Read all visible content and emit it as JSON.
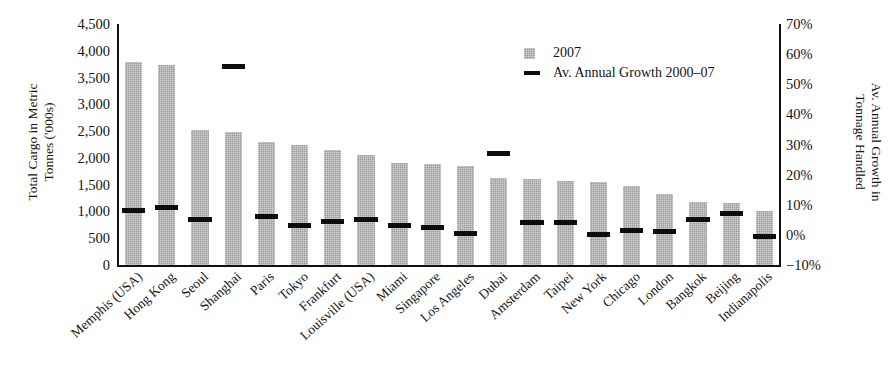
{
  "chart_data": {
    "type": "bar",
    "title": "",
    "subtitle": "",
    "xlabel": "",
    "ylabel": "Total Cargo in Metric Tonnes ('000s)",
    "ylabel_line1": "Total Cargo in Metric",
    "ylabel_line2": "Tonnes ('000s)",
    "y2label": "Av. Annual Growth in Tonnage Handled",
    "y2label_line1": "Av. Annual Growth in",
    "y2label_line2": "Tonnage Handled",
    "grid": false,
    "legend_position": "top-right",
    "ylim": [
      0,
      4500
    ],
    "y2lim": [
      -10,
      70
    ],
    "yticks": [
      0,
      500,
      1000,
      1500,
      2000,
      2500,
      3000,
      3500,
      4000,
      4500
    ],
    "ytick_labels": [
      "0",
      "500",
      "1,000",
      "1,500",
      "2,000",
      "2,500",
      "3,000",
      "3,500",
      "4,000",
      "4,500"
    ],
    "y2ticks": [
      -10,
      0,
      10,
      20,
      30,
      40,
      50,
      60,
      70
    ],
    "y2tick_labels": [
      "−10%",
      "0%",
      "10%",
      "20%",
      "30%",
      "40%",
      "50%",
      "60%",
      "70%"
    ],
    "categories": [
      "Memphis (USA)",
      "Hong Kong",
      "Seoul",
      "Shanghai",
      "Paris",
      "Tokyo",
      "Frankfurt",
      "Louisville (USA)",
      "Miami",
      "Singapore",
      "Los Angeles",
      "Dubai",
      "Amsterdam",
      "Taipei",
      "New York",
      "Chicago",
      "London",
      "Bangkok",
      "Beijing",
      "Indianapolis"
    ],
    "series": [
      {
        "name": "2007",
        "axis": "left",
        "unit": "'000 tonnes",
        "type": "bar",
        "color": "#9b9b9b",
        "values": [
          3800,
          3730,
          2530,
          2480,
          2290,
          2240,
          2140,
          2060,
          1900,
          1890,
          1840,
          1620,
          1600,
          1560,
          1550,
          1470,
          1330,
          1180,
          1150,
          1010
        ]
      },
      {
        "name": "Av. Annual Growth 2000–07",
        "axis": "right",
        "unit": "%",
        "type": "marker",
        "color": "#0d0d0d",
        "values": [
          8.0,
          9.0,
          5.0,
          56.0,
          6.0,
          3.0,
          4.5,
          5.0,
          3.0,
          2.5,
          0.5,
          27.0,
          4.0,
          4.0,
          0.0,
          1.5,
          1.0,
          5.0,
          7.0,
          -0.5
        ]
      }
    ],
    "legend": [
      {
        "label": "2007",
        "key": "swatch-box",
        "color": "#9b9b9b"
      },
      {
        "label": "Av. Annual Growth 2000–07",
        "key": "swatch-line",
        "color": "#0d0d0d"
      }
    ]
  }
}
